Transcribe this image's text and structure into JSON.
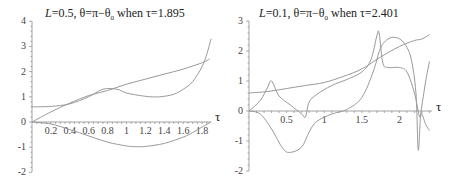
{
  "chart_data": [
    {
      "type": "line",
      "title": "L=0.5,  θ=π−θ0 when τ=1.895",
      "title_parts": {
        "L_italic": "L",
        "rest": "=0.5,  θ=π−θ",
        "sub": "0",
        "tail": " when τ=1.895"
      },
      "xlabel": "τ",
      "ylabel": "",
      "xlim": [
        0,
        1.895
      ],
      "ylim": [
        -2,
        4
      ],
      "x_ticks": [
        "0.2",
        "0.4",
        "0.6",
        "0.8",
        "1",
        "1.2",
        "1.4",
        "1.6",
        "1.8"
      ],
      "y_ticks": [
        "-2",
        "-1",
        "0",
        "1",
        "2",
        "3",
        "4"
      ],
      "grid": false,
      "series": [
        {
          "name": "linear",
          "x": [
            0,
            0.2,
            0.4,
            0.6,
            0.8,
            1.0,
            1.2,
            1.4,
            1.6,
            1.8,
            1.88
          ],
          "y": [
            0,
            0.4,
            0.75,
            1.05,
            1.25,
            1.5,
            1.7,
            1.9,
            2.1,
            2.35,
            2.5
          ]
        },
        {
          "name": "upper",
          "x": [
            0,
            0.2,
            0.4,
            0.6,
            0.75,
            0.9,
            1.0,
            1.2,
            1.35,
            1.5,
            1.6,
            1.7,
            1.8,
            1.85,
            1.895
          ],
          "y": [
            0.6,
            0.62,
            0.72,
            1.0,
            1.3,
            1.3,
            1.15,
            1.02,
            1.0,
            1.1,
            1.3,
            1.6,
            2.2,
            2.7,
            3.3
          ]
        },
        {
          "name": "lower",
          "x": [
            0,
            0.2,
            0.4,
            0.6,
            0.8,
            1.0,
            1.1,
            1.2,
            1.4,
            1.6,
            1.7,
            1.8,
            1.895
          ],
          "y": [
            0,
            -0.08,
            -0.3,
            -0.55,
            -0.8,
            -0.95,
            -0.98,
            -0.97,
            -0.85,
            -0.6,
            -0.42,
            -0.2,
            0
          ]
        }
      ]
    },
    {
      "type": "line",
      "title": "L=0.1,  θ=π−θ0 when τ=2.401",
      "title_parts": {
        "L_italic": "L",
        "rest": "=0.1,  θ=π−θ",
        "sub": "0",
        "tail": " when τ=2.401"
      },
      "xlabel": "τ",
      "ylabel": "",
      "xlim": [
        0,
        2.401
      ],
      "ylim": [
        -2,
        3
      ],
      "x_ticks": [
        "0.5",
        "1",
        "1.5",
        "2"
      ],
      "y_ticks": [
        "-2",
        "-1",
        "0",
        "1",
        "2",
        "3"
      ],
      "grid": false,
      "series": [
        {
          "name": "smooth-increasing",
          "x": [
            0,
            0.25,
            0.5,
            0.75,
            1.0,
            1.25,
            1.5,
            1.75,
            2.0,
            2.2,
            2.3,
            2.4
          ],
          "y": [
            0.6,
            0.65,
            0.75,
            0.85,
            0.95,
            1.15,
            1.4,
            1.8,
            2.15,
            2.35,
            2.4,
            2.55
          ]
        },
        {
          "name": "spiky",
          "x": [
            0,
            0.15,
            0.25,
            0.3,
            0.4,
            0.55,
            0.7,
            0.75,
            0.8,
            0.9,
            1.1,
            1.3,
            1.5,
            1.62,
            1.7,
            1.73,
            1.78,
            1.85,
            2.0,
            2.1,
            2.2,
            2.27,
            2.3,
            2.35,
            2.4
          ],
          "y": [
            0,
            0.35,
            0.8,
            1.0,
            0.5,
            0.2,
            -0.1,
            -0.2,
            0.3,
            0.55,
            0.85,
            1.05,
            1.3,
            1.7,
            2.5,
            2.6,
            1.6,
            1.45,
            1.45,
            1.3,
            0.6,
            -0.2,
            0.2,
            1.0,
            1.65
          ]
        },
        {
          "name": "deep-dip",
          "x": [
            0,
            0.15,
            0.3,
            0.45,
            0.55,
            0.7,
            0.8,
            0.9,
            1.1,
            1.3,
            1.5,
            1.65,
            1.75,
            1.85,
            1.95,
            2.05,
            2.15,
            2.22,
            2.25,
            2.28,
            2.3,
            2.35,
            2.4
          ],
          "y": [
            0,
            -0.1,
            -0.6,
            -1.25,
            -1.38,
            -1.2,
            -0.7,
            -0.35,
            -0.1,
            0.05,
            0.45,
            1.3,
            2.1,
            2.4,
            2.45,
            2.3,
            1.8,
            0.6,
            -1.3,
            -0.2,
            -0.1,
            -0.45,
            -0.65
          ]
        }
      ]
    }
  ]
}
